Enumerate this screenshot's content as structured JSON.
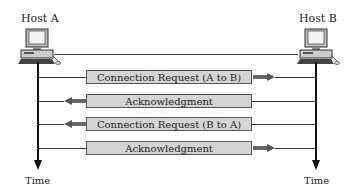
{
  "hosts": {
    "a": {
      "label": "Host A",
      "time_label": "Time"
    },
    "b": {
      "label": "Host B",
      "time_label": "Time"
    }
  },
  "messages": [
    {
      "label": "Connection Request (A to B)",
      "direction": "right"
    },
    {
      "label": "Acknowledgment",
      "direction": "left"
    },
    {
      "label": "Connection Request (B to A)",
      "direction": "left"
    },
    {
      "label": "Acknowledgment",
      "direction": "right"
    }
  ],
  "colors": {
    "box_fill": "#d4d4d4",
    "arrow": "#666666",
    "line": "#111111"
  }
}
